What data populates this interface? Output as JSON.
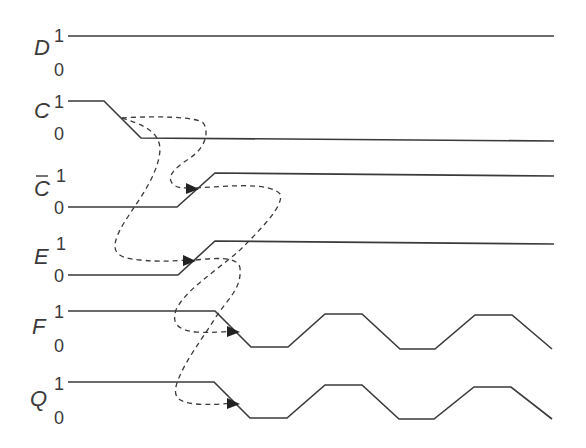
{
  "diagram": {
    "type": "timing-diagram",
    "colors": {
      "line": "#3a3a3a",
      "background": "#ffffff"
    },
    "signals": [
      {
        "id": "D",
        "label": "D",
        "overbar": false,
        "high_label": "1",
        "low_label": "0",
        "points": [
          [
            68,
            36
          ],
          [
            554,
            36
          ]
        ]
      },
      {
        "id": "C",
        "label": "C",
        "overbar": false,
        "high_label": "1",
        "low_label": "0",
        "points": [
          [
            68,
            101
          ],
          [
            104,
            101
          ],
          [
            141,
            138
          ],
          [
            554,
            141
          ]
        ]
      },
      {
        "id": "Cbar",
        "label": "C",
        "overbar": true,
        "high_label": "1",
        "low_label": "0",
        "points": [
          [
            68,
            207
          ],
          [
            177,
            207
          ],
          [
            215,
            173
          ],
          [
            554,
            176
          ]
        ]
      },
      {
        "id": "E",
        "label": "E",
        "overbar": false,
        "high_label": "1",
        "low_label": "0",
        "points": [
          [
            68,
            275
          ],
          [
            178,
            275
          ],
          [
            215,
            241
          ],
          [
            554,
            244
          ]
        ]
      },
      {
        "id": "F",
        "label": "F",
        "overbar": false,
        "high_label": "1",
        "low_label": "0",
        "points": [
          [
            68,
            311
          ],
          [
            215,
            311
          ],
          [
            251,
            347
          ],
          [
            288,
            347
          ],
          [
            325,
            314
          ],
          [
            362,
            314
          ],
          [
            400,
            349
          ],
          [
            435,
            349
          ],
          [
            475,
            315
          ],
          [
            512,
            315
          ],
          [
            552,
            349
          ]
        ]
      },
      {
        "id": "Q",
        "label": "Q",
        "overbar": false,
        "high_label": "1",
        "low_label": "0",
        "points": [
          [
            68,
            382
          ],
          [
            214,
            382
          ],
          [
            250,
            418
          ],
          [
            287,
            418
          ],
          [
            325,
            385
          ],
          [
            362,
            385
          ],
          [
            399,
            419
          ],
          [
            434,
            419
          ],
          [
            474,
            387
          ],
          [
            511,
            387
          ],
          [
            552,
            419
          ]
        ]
      }
    ],
    "causal_arrows": [
      {
        "from": "C",
        "to": "Cbar",
        "description": "C falling edge causes C-bar rising edge"
      },
      {
        "from": "C",
        "to": "E",
        "description": "C falling edge causes E rising edge"
      },
      {
        "from": "Cbar",
        "to": "F",
        "description": "C-bar rising edge causes F falling edge"
      },
      {
        "from": "E",
        "to": "Q",
        "description": "E rising edge causes Q falling edge"
      }
    ]
  }
}
